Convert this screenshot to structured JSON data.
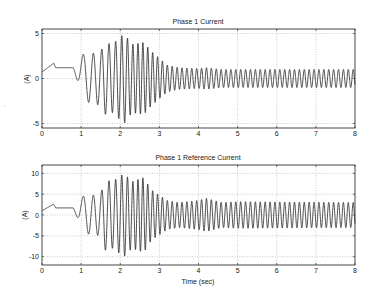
{
  "chart_data": [
    {
      "type": "line",
      "title": "Phase 1 Current",
      "xlabel": "",
      "ylabel": "(A)",
      "xlim": [
        0,
        8
      ],
      "ylim": [
        -5.5,
        5.5
      ],
      "xticks": [
        0,
        1,
        2,
        3,
        4,
        5,
        6,
        7,
        8
      ],
      "yticks": [
        -5,
        0,
        5
      ],
      "grid": true,
      "series": [
        {
          "name": "Phase 1 Current",
          "description": "Initial ~1.2 A offset 0-0.8 s (ramp to ~1.7 A at 0.3 s), then growing oscillation peaking ~+/-5 A near 2.1 s, decaying to steady ~+/-1 A oscillation from ~3 s to 8 s",
          "envelope_points": [
            [
              0.8,
              0.3
            ],
            [
              1.1,
              2.6
            ],
            [
              1.5,
              3.0
            ],
            [
              1.6,
              4.0
            ],
            [
              1.8,
              3.8
            ],
            [
              2.1,
              5.0
            ],
            [
              2.3,
              3.8
            ],
            [
              2.6,
              4.0
            ],
            [
              2.8,
              3.0
            ],
            [
              3.2,
              1.5
            ],
            [
              3.5,
              1.2
            ],
            [
              4.0,
              1.1
            ],
            [
              4.2,
              1.2
            ],
            [
              4.6,
              1.0
            ],
            [
              5.0,
              1.0
            ],
            [
              8.0,
              1.0
            ]
          ]
        }
      ]
    },
    {
      "type": "line",
      "title": "Phase 1 Reference Current",
      "xlabel": "Time (sec)",
      "ylabel": "(A)",
      "xlim": [
        0,
        8
      ],
      "ylim": [
        -12,
        12
      ],
      "xticks": [
        0,
        1,
        2,
        3,
        4,
        5,
        6,
        7,
        8
      ],
      "yticks": [
        -10,
        -5,
        0,
        5,
        10
      ],
      "grid": true,
      "series": [
        {
          "name": "Phase 1 Reference Current",
          "description": "Initial ~1.7 A offset 0-0.8 s (ramp to ~2.6 A at 0.3 s), then growing oscillation peaking ~+/-10 A near 2.1 s, decaying to steady ~+/-3 A oscillation from ~3 s to 8 s",
          "envelope_points": [
            [
              0.8,
              0.5
            ],
            [
              1.1,
              4.5
            ],
            [
              1.5,
              5.0
            ],
            [
              1.6,
              8.5
            ],
            [
              1.8,
              8.0
            ],
            [
              2.1,
              10.0
            ],
            [
              2.3,
              8.0
            ],
            [
              2.6,
              9.0
            ],
            [
              2.8,
              6.0
            ],
            [
              3.2,
              3.5
            ],
            [
              3.5,
              3.0
            ],
            [
              4.0,
              3.5
            ],
            [
              4.2,
              4.0
            ],
            [
              4.6,
              3.0
            ],
            [
              5.0,
              3.2
            ],
            [
              8.0,
              3.0
            ]
          ]
        }
      ]
    }
  ],
  "plots": [
    {
      "title": "Phase 1 Current",
      "ylabel": "(A)",
      "xlabel": ""
    },
    {
      "title": "Phase 1 Reference Current",
      "ylabel": "(A)",
      "xlabel": "Time (sec)"
    }
  ]
}
